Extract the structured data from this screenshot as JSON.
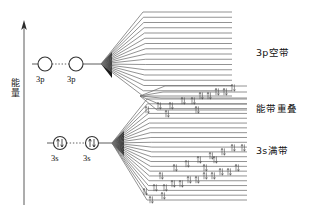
{
  "figure": {
    "type": "energy-band-diagram",
    "axis": {
      "name": "energy-axis",
      "label_chars": [
        "能",
        "量"
      ],
      "label": "能量",
      "direction": "up",
      "x": 24,
      "y_top": 22,
      "y_bottom": 205
    },
    "atomic_levels": [
      {
        "name": "3p-orbital-left",
        "label": "3p",
        "cx": 45,
        "cy": 64,
        "r": 7,
        "occupancy": "empty",
        "electrons": 0
      },
      {
        "name": "3p-orbital-right",
        "label": "3p",
        "cx": 76,
        "cy": 64,
        "r": 7,
        "occupancy": "empty",
        "electrons": 0
      },
      {
        "name": "3s-orbital-left",
        "label": "3s",
        "cx": 60,
        "cy": 143,
        "r": 6.5,
        "occupancy": "paired",
        "electrons": 2
      },
      {
        "name": "3s-orbital-right",
        "label": "3s",
        "cx": 92,
        "cy": 143,
        "r": 6.5,
        "occupancy": "paired",
        "electrons": 2
      }
    ],
    "bands": [
      {
        "name": "3p-band",
        "label": "3p空带",
        "occupancy": "empty",
        "vertex_x": 101,
        "vertex_y": 64,
        "flat_start_x": 146,
        "flat_end_x": 232,
        "top_y": 12,
        "bottom_y": 96,
        "line_count": 17,
        "electron_marks": 0
      },
      {
        "name": "overlap-band",
        "label": "能带重叠",
        "occupancy": "partial",
        "vertex_x": 140,
        "vertex_y": 96,
        "flat_start_x": 165,
        "flat_end_x": 247,
        "top_y": 86,
        "bottom_y": 110,
        "line_count": 5,
        "electron_marks": 12
      },
      {
        "name": "3s-band",
        "label": "3s满带",
        "occupancy": "full",
        "vertex_x": 112,
        "vertex_y": 143,
        "flat_start_x": 152,
        "flat_end_x": 247,
        "top_y": 99,
        "bottom_y": 200,
        "line_count": 22,
        "electron_marks": 24
      }
    ],
    "labels": {
      "band_3p_empty": "3p空带",
      "band_overlap": "能带重叠",
      "band_3s_full": "3s满带",
      "orbital_3p_a": "3p",
      "orbital_3p_b": "3p",
      "orbital_3s_a": "3s",
      "orbital_3s_b": "3s"
    },
    "colors": {
      "line": "#6d6d6d",
      "line_dark": "#3a3a3a",
      "text": "#111111",
      "background": "#ffffff"
    }
  }
}
